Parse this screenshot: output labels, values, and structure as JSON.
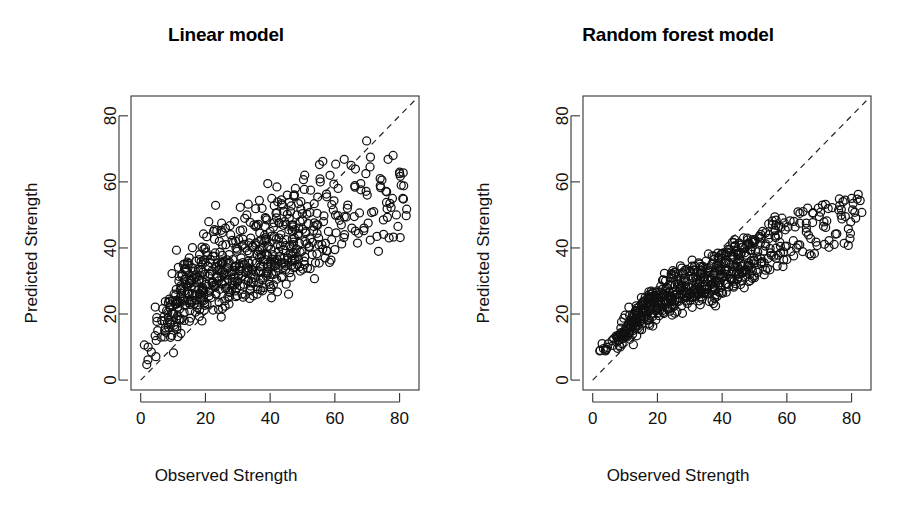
{
  "figure": {
    "background": "#ffffff",
    "width": 904,
    "height": 522,
    "point_color": "#111111",
    "refline_color": "#222222",
    "axis_color": "#333333"
  },
  "panels": [
    {
      "key": "linear",
      "title": "Linear model",
      "xlabel": "Observed Strength",
      "ylabel": "Predicted Strength"
    },
    {
      "key": "rf",
      "title": "Random forest model",
      "xlabel": "Observed Strength",
      "ylabel": "Predicted Strength"
    }
  ],
  "axes": {
    "x_ticks": [
      "0",
      "20",
      "40",
      "60",
      "80"
    ],
    "y_ticks": [
      "0",
      "20",
      "40",
      "60",
      "80"
    ]
  },
  "chart_data": {
    "type": "scatter",
    "xlabel": "Observed Strength",
    "ylabel": "Predicted Strength",
    "xlim": [
      -3.0,
      86.0
    ],
    "ylim": [
      -3.0,
      86.0
    ],
    "xticks": [
      0,
      20,
      40,
      60,
      80
    ],
    "yticks": [
      0,
      20,
      40,
      60,
      80
    ],
    "grid": false,
    "legend": "none",
    "marker": "open-circle",
    "marker_radius_px": 4,
    "annotations": [
      {
        "name": "identity-line",
        "type": "line",
        "style": "dashed",
        "from": [
          0,
          0
        ],
        "to": [
          85,
          85
        ],
        "label": "y = x reference line"
      }
    ],
    "panels": [
      {
        "name": "Linear model",
        "x": [
          2.3,
          3.3,
          4.8,
          6.3,
          6.5,
          7.4,
          7.8,
          8.0,
          8.5,
          9.0,
          9.1,
          9.6,
          9.9,
          10.2,
          10.3,
          10.5,
          10.8,
          11.0,
          11.4,
          11.8,
          12.0,
          12.2,
          12.5,
          12.6,
          12.8,
          13.0,
          13.2,
          13.4,
          13.5,
          13.7,
          14.0,
          14.2,
          14.5,
          14.8,
          15.0,
          15.2,
          15.4,
          15.6,
          15.8,
          16.0,
          16.2,
          16.5,
          16.8,
          17.0,
          17.2,
          17.5,
          17.8,
          18.0,
          18.2,
          18.5,
          18.8,
          19.0,
          19.2,
          19.5,
          19.8,
          20.0,
          20.3,
          20.5,
          20.8,
          21.0,
          21.3,
          21.5,
          21.8,
          22.0,
          22.3,
          22.5,
          22.8,
          23.0,
          23.3,
          23.5,
          23.8,
          24.0,
          24.3,
          24.5,
          24.8,
          25.0,
          25.3,
          25.5,
          25.8,
          26.0,
          26.3,
          26.5,
          26.8,
          27.0,
          27.3,
          27.5,
          27.8,
          28.0,
          28.3,
          28.5,
          28.8,
          29.0,
          29.3,
          29.5,
          29.8,
          30.0,
          30.3,
          30.5,
          30.8,
          31.0,
          31.3,
          31.5,
          31.8,
          32.0,
          32.3,
          32.5,
          32.8,
          33.0,
          33.3,
          33.5,
          33.8,
          34.0,
          34.3,
          34.5,
          34.8,
          35.0,
          35.3,
          35.5,
          35.8,
          36.0,
          36.3,
          36.5,
          36.8,
          37.0,
          37.3,
          37.5,
          37.8,
          38.0,
          38.3,
          38.5,
          38.8,
          39.0,
          39.3,
          39.5,
          39.8,
          40.0,
          40.3,
          40.5,
          40.8,
          41.0,
          41.3,
          41.5,
          41.8,
          42.0,
          42.3,
          42.5,
          42.8,
          43.0,
          43.3,
          43.5,
          43.8,
          44.0,
          44.3,
          44.5,
          44.8,
          45.0,
          45.3,
          45.5,
          45.8,
          46.0,
          46.3,
          46.5,
          46.8,
          47.0,
          47.3,
          47.5,
          47.8,
          48.0,
          48.3,
          48.5,
          48.8,
          49.0,
          49.3,
          49.5,
          49.8,
          50.0,
          50.5,
          51.0,
          51.5,
          52.0,
          52.5,
          53.0,
          53.5,
          54.0,
          54.5,
          55.0,
          55.5,
          56.0,
          56.5,
          57.0,
          57.5,
          58.0,
          58.5,
          59.0,
          59.5,
          60.0,
          61.0,
          62.0,
          63.0,
          64.0,
          65.0,
          66.0,
          67.0,
          68.0,
          69.0,
          70.0,
          71.0,
          72.0,
          73.0,
          74.0,
          75.0,
          76.0,
          77.0,
          78.0,
          79.0,
          79.5,
          80.0,
          80.5,
          81.0
        ],
        "y": [
          10.0,
          8.5,
          12.0,
          13.0,
          18.0,
          15.0,
          14.5,
          21.0,
          19.0,
          22.0,
          17.5,
          13.5,
          24.0,
          20.0,
          26.0,
          16.0,
          23.0,
          27.5,
          19.5,
          30.0,
          21.5,
          25.0,
          18.5,
          28.0,
          32.0,
          24.5,
          35.0,
          20.5,
          27.0,
          22.5,
          29.0,
          33.0,
          26.5,
          24.0,
          37.0,
          21.0,
          30.5,
          28.5,
          23.5,
          34.0,
          26.0,
          31.0,
          25.5,
          36.0,
          29.5,
          22.0,
          33.5,
          27.5,
          38.0,
          24.5,
          30.0,
          35.0,
          28.0,
          26.5,
          32.0,
          40.0,
          29.0,
          23.0,
          34.5,
          31.5,
          27.0,
          36.5,
          25.0,
          33.0,
          29.5,
          45.0,
          28.5,
          38.5,
          26.0,
          31.0,
          35.5,
          30.0,
          42.0,
          27.5,
          33.5,
          47.5,
          29.0,
          36.0,
          32.5,
          24.0,
          41.0,
          28.0,
          34.0,
          30.5,
          38.0,
          26.5,
          44.0,
          32.0,
          29.5,
          36.5,
          31.0,
          48.0,
          27.0,
          34.5,
          39.0,
          30.0,
          42.5,
          33.0,
          28.5,
          37.0,
          31.5,
          45.5,
          29.0,
          35.0,
          40.0,
          32.5,
          50.0,
          34.0,
          30.0,
          38.5,
          27.5,
          43.0,
          33.5,
          36.0,
          29.5,
          47.0,
          31.0,
          41.5,
          35.5,
          26.0,
          39.0,
          33.0,
          44.5,
          30.5,
          37.5,
          52.0,
          34.5,
          28.0,
          42.0,
          36.5,
          31.5,
          48.5,
          33.0,
          40.5,
          29.0,
          45.0,
          35.0,
          55.0,
          38.0,
          32.0,
          43.5,
          36.0,
          50.5,
          30.5,
          41.0,
          34.0,
          47.5,
          37.5,
          44.0,
          31.0,
          53.0,
          39.5,
          35.5,
          48.0,
          33.5,
          42.5,
          56.0,
          37.0,
          45.5,
          32.5,
          51.0,
          40.0,
          36.5,
          47.0,
          34.0,
          43.0,
          58.0,
          38.5,
          50.0,
          35.0,
          46.0,
          41.5,
          33.0,
          54.0,
          39.0,
          48.5,
          36.0,
          44.5,
          52.5,
          40.5,
          57.5,
          38.0,
          46.5,
          35.5,
          50.5,
          43.0,
          60.0,
          41.0,
          48.0,
          37.0,
          55.5,
          45.0,
          62.0,
          42.5,
          51.5,
          39.5,
          58.0,
          47.0,
          44.0,
          53.0,
          65.0,
          49.5,
          41.5,
          59.5,
          46.0,
          56.0,
          67.5,
          51.0,
          43.5,
          61.0,
          48.5,
          57.0,
          53.5,
          68.0,
          50.0,
          46.5,
          62.5,
          59.0,
          55.0,
          71.0,
          52.0,
          57.5,
          63.0,
          49.0,
          60.5,
          56.5,
          80.0,
          58.5,
          54.0,
          68.5,
          61.5,
          64.5,
          59.5,
          55.5,
          62.0,
          57.0,
          60.0,
          53.5,
          58.0,
          56.0,
          54.5
        ]
      },
      {
        "name": "Random forest model",
        "x": [
          2.3,
          3.3,
          4.8,
          6.3,
          6.5,
          7.4,
          7.8,
          8.0,
          8.5,
          9.0,
          9.1,
          9.6,
          9.9,
          10.2,
          10.3,
          10.5,
          10.8,
          11.0,
          11.4,
          11.8,
          12.0,
          12.2,
          12.5,
          12.6,
          12.8,
          13.0,
          13.2,
          13.4,
          13.5,
          13.7,
          14.0,
          14.2,
          14.5,
          14.8,
          15.0,
          15.2,
          15.4,
          15.6,
          15.8,
          16.0,
          16.2,
          16.5,
          16.8,
          17.0,
          17.2,
          17.5,
          17.8,
          18.0,
          18.2,
          18.5,
          18.8,
          19.0,
          19.2,
          19.5,
          19.8,
          20.0,
          20.3,
          20.5,
          20.8,
          21.0,
          21.3,
          21.5,
          21.8,
          22.0,
          22.3,
          22.5,
          22.8,
          23.0,
          23.3,
          23.5,
          23.8,
          24.0,
          24.3,
          24.5,
          24.8,
          25.0,
          25.3,
          25.5,
          25.8,
          26.0,
          26.3,
          26.5,
          26.8,
          27.0,
          27.3,
          27.5,
          27.8,
          28.0,
          28.3,
          28.5,
          28.8,
          29.0,
          29.3,
          29.5,
          29.8,
          30.0,
          30.3,
          30.5,
          30.8,
          31.0,
          31.3,
          31.5,
          31.8,
          32.0,
          32.3,
          32.5,
          32.8,
          33.0,
          33.3,
          33.5,
          33.8,
          34.0,
          34.3,
          34.5,
          34.8,
          35.0,
          35.3,
          35.5,
          35.8,
          36.0,
          36.3,
          36.5,
          36.8,
          37.0,
          37.3,
          37.5,
          37.8,
          38.0,
          38.3,
          38.5,
          38.8,
          39.0,
          39.3,
          39.5,
          39.8,
          40.0,
          40.3,
          40.5,
          40.8,
          41.0,
          41.3,
          41.5,
          41.8,
          42.0,
          42.3,
          42.5,
          42.8,
          43.0,
          43.3,
          43.5,
          43.8,
          44.0,
          44.3,
          44.5,
          44.8,
          45.0,
          45.3,
          45.5,
          45.8,
          46.0,
          46.3,
          46.5,
          46.8,
          47.0,
          47.3,
          47.5,
          47.8,
          48.0,
          48.3,
          48.5,
          48.8,
          49.0,
          49.3,
          49.5,
          49.8,
          50.0,
          50.5,
          51.0,
          51.5,
          52.0,
          52.5,
          53.0,
          53.5,
          54.0,
          54.5,
          55.0,
          55.5,
          56.0,
          56.5,
          57.0,
          57.5,
          58.0,
          58.5,
          59.0,
          59.5,
          60.0,
          61.0,
          62.0,
          63.0,
          64.0,
          65.0,
          66.0,
          67.0,
          68.0,
          69.0,
          70.0,
          71.0,
          72.0,
          73.0,
          74.0,
          75.0,
          76.0,
          77.0,
          78.0,
          79.0,
          79.5,
          80.0,
          80.5,
          81.0
        ],
        "y": [
          9.0,
          9.5,
          11.0,
          10.5,
          12.5,
          11.5,
          13.0,
          12.0,
          14.0,
          13.5,
          11.0,
          12.8,
          15.0,
          14.2,
          16.0,
          13.0,
          15.5,
          17.0,
          14.8,
          18.0,
          16.2,
          17.5,
          15.0,
          19.0,
          20.0,
          18.2,
          21.0,
          16.5,
          19.5,
          17.8,
          20.5,
          22.0,
          19.0,
          18.0,
          23.0,
          17.0,
          21.5,
          20.2,
          18.5,
          24.0,
          20.8,
          22.5,
          19.8,
          25.0,
          23.2,
          18.2,
          24.5,
          21.2,
          26.0,
          20.0,
          23.5,
          25.5,
          22.0,
          21.0,
          24.8,
          27.0,
          23.0,
          19.5,
          26.5,
          25.0,
          22.2,
          27.5,
          20.5,
          26.2,
          24.0,
          30.0,
          23.5,
          28.0,
          21.5,
          25.2,
          28.5,
          24.2,
          31.0,
          22.8,
          26.8,
          32.0,
          24.0,
          28.8,
          26.0,
          20.8,
          30.5,
          23.8,
          27.8,
          25.8,
          30.2,
          22.5,
          32.5,
          27.0,
          25.5,
          29.8,
          26.5,
          33.5,
          23.2,
          28.2,
          31.5,
          26.2,
          33.0,
          28.0,
          25.0,
          30.8,
          27.2,
          34.5,
          25.2,
          29.5,
          32.8,
          28.5,
          35.5,
          29.2,
          26.8,
          32.2,
          24.5,
          34.2,
          29.8,
          31.2,
          26.2,
          36.0,
          27.8,
          33.8,
          30.5,
          23.8,
          32.5,
          29.0,
          35.0,
          27.5,
          31.8,
          37.5,
          30.2,
          25.8,
          34.8,
          31.0,
          28.8,
          37.0,
          29.5,
          34.0,
          26.5,
          36.8,
          31.5,
          38.5,
          33.2,
          29.2,
          36.2,
          32.0,
          39.5,
          28.2,
          35.2,
          30.8,
          38.8,
          32.8,
          37.2,
          28.5,
          40.5,
          34.2,
          32.2,
          39.0,
          30.5,
          36.5,
          41.5,
          33.5,
          38.2,
          30.0,
          40.2,
          35.0,
          33.0,
          39.8,
          31.2,
          37.8,
          43.0,
          34.8,
          41.0,
          32.0,
          39.2,
          36.2,
          30.8,
          42.5,
          35.2,
          41.8,
          33.2,
          38.8,
          43.5,
          36.8,
          45.0,
          35.5,
          41.2,
          33.8,
          44.0,
          38.5,
          47.0,
          37.5,
          43.2,
          34.5,
          46.5,
          40.5,
          49.0,
          38.8,
          45.5,
          36.5,
          48.2,
          42.2,
          40.0,
          47.5,
          51.0,
          44.8,
          38.2,
          50.5,
          41.8,
          49.5,
          53.0,
          46.2,
          40.2,
          52.2,
          44.2,
          51.5,
          48.8,
          54.5,
          45.8,
          42.8,
          55.0,
          53.5,
          50.8,
          57.0,
          48.2,
          54.2,
          58.5,
          46.8,
          56.2,
          52.8,
          71.5,
          57.8,
          51.2,
          60.5,
          59.5,
          62.0,
          72.5,
          53.2,
          64.5,
          70.0,
          68.5,
          52.0,
          51.5
        ]
      }
    ]
  }
}
